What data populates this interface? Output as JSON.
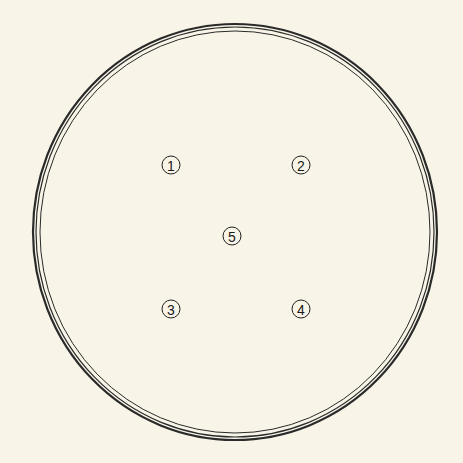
{
  "diagram": {
    "type": "petri-dish-layout",
    "background": "#f8f5e8",
    "stroke_color": "#2a2a2a",
    "dish": {
      "center": [
        235,
        232
      ],
      "rings": [
        {
          "rx": 202,
          "ry": 208,
          "width": 2.2
        },
        {
          "rx": 199,
          "ry": 205,
          "width": 1.2
        },
        {
          "rx": 195,
          "ry": 201,
          "width": 1.0
        }
      ]
    },
    "markers": [
      {
        "label": "1",
        "x": 171,
        "y": 165
      },
      {
        "label": "2",
        "x": 301,
        "y": 165
      },
      {
        "label": "5",
        "x": 232,
        "y": 236
      },
      {
        "label": "3",
        "x": 171,
        "y": 309
      },
      {
        "label": "4",
        "x": 301,
        "y": 309
      }
    ]
  }
}
